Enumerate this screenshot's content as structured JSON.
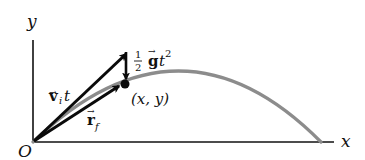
{
  "diagram": {
    "axes": {
      "x_label": "x",
      "y_label": "y",
      "origin_label": "O"
    },
    "labels": {
      "initial_velocity_term": {
        "vector": "v",
        "subscript": "i",
        "suffix": "t"
      },
      "gravity_term": {
        "frac_num": "1",
        "frac_den": "2",
        "vector": "g",
        "suffix": "t",
        "power": "2"
      },
      "final_position": {
        "vector": "r",
        "subscript": "f"
      },
      "point": "(x, y)"
    },
    "colors": {
      "axis": "#111111",
      "vector": "#0a0a0a",
      "trajectory": "#8c8c8c",
      "background": "#ffffff"
    }
  }
}
